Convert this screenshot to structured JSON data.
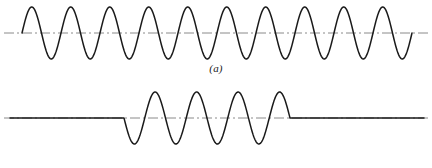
{
  "figure": {
    "background_color": "#ffffff",
    "ink_color": "#1a1a1a",
    "axis_color": "#8a8a8a",
    "width": 432,
    "height": 168
  },
  "panels": [
    {
      "caption": "(a)",
      "name": "continuous-sine-wave"
    },
    {
      "caption": "(b)",
      "name": "gated-burst-sine-wave"
    }
  ],
  "chart_data": [
    {
      "type": "line",
      "name": "continuous-sinusoid",
      "title": "(a)",
      "xlabel": "",
      "ylabel": "",
      "grid": false,
      "legend": "none",
      "xlim": [
        0,
        432
      ],
      "ylim": [
        -1.25,
        1.25
      ],
      "baseline_y_px": 33,
      "amplitude_px": 26,
      "cycles": 10,
      "wave_start_px": 22,
      "wave_end_px": 412,
      "period_px": 39,
      "phase": "starts at zero rising",
      "axis_line": {
        "style": "dash-dot",
        "y_px": 33,
        "x_start_px": 4,
        "x_end_px": 428,
        "solid_from_px": 22,
        "solid_to_px": 412
      },
      "series": [
        {
          "name": "sin(2*pi*t/T)",
          "x": [
            22,
            31.75,
            41.5,
            51.25,
            61,
            70.75,
            80.5,
            90.25,
            100,
            109.75,
            119.5,
            129.25,
            139,
            148.75,
            158.5,
            168.25,
            178,
            187.75,
            197.5,
            207.25,
            217,
            226.75,
            236.5,
            246.25,
            256,
            265.75,
            275.5,
            285.25,
            295,
            304.75,
            314.5,
            324.25,
            334,
            343.75,
            353.5,
            363.25,
            373,
            382.75,
            392.5,
            402.25,
            412
          ],
          "y": [
            0,
            1,
            0,
            -1,
            0,
            1,
            0,
            -1,
            0,
            1,
            0,
            -1,
            0,
            1,
            0,
            -1,
            0,
            1,
            0,
            -1,
            0,
            1,
            0,
            -1,
            0,
            1,
            0,
            -1,
            0,
            1,
            0,
            -1,
            0,
            1,
            0,
            -1,
            0,
            1,
            0,
            -1,
            0
          ]
        }
      ]
    },
    {
      "type": "line",
      "name": "gated-sinusoid-burst",
      "title": "(b)",
      "xlabel": "",
      "ylabel": "",
      "grid": false,
      "legend": "none",
      "xlim": [
        0,
        432
      ],
      "ylim": [
        -1.25,
        1.25
      ],
      "baseline_y_px": 118,
      "amplitude_px": 26,
      "cycles": 4,
      "burst_start_px": 124,
      "burst_end_px": 290,
      "period_px": 41.5,
      "phase": "starts at zero falling",
      "flat_left": {
        "x_start_px": 10,
        "x_end_px": 124,
        "y": 0
      },
      "flat_right": {
        "x_start_px": 290,
        "x_end_px": 424,
        "y": 0
      },
      "axis_line": {
        "style": "dash-dot",
        "y_px": 118,
        "x_start_px": 4,
        "x_end_px": 428
      },
      "series": [
        {
          "name": "gate(t)*sin(2*pi*t/T)",
          "x": [
            10,
            124,
            134.4,
            144.75,
            155.1,
            165.5,
            175.9,
            186.25,
            196.6,
            207,
            217.4,
            227.75,
            238.1,
            248.5,
            258.9,
            269.25,
            279.6,
            290,
            424
          ],
          "y": [
            0,
            0,
            -1,
            0,
            1,
            0,
            -1,
            0,
            1,
            0,
            -1,
            0,
            1,
            0,
            -1,
            0,
            1,
            0,
            0
          ]
        }
      ]
    }
  ]
}
